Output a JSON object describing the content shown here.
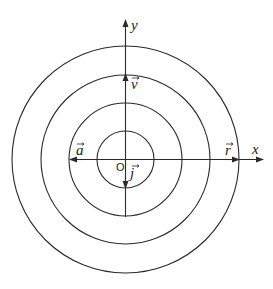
{
  "diagram": {
    "type": "concentric-circles-with-axes",
    "circle_count": 4,
    "colors": {
      "stroke": "#2a2a2a",
      "background": "#ffffff"
    },
    "axes": {
      "x_label": "x",
      "y_label": "y",
      "origin_label": "O"
    },
    "vectors": [
      {
        "id": "v",
        "label": "v",
        "direction": "up"
      },
      {
        "id": "a",
        "label": "a",
        "direction": "left"
      },
      {
        "id": "r",
        "label": "r",
        "direction": "right"
      },
      {
        "id": "j",
        "label": "j",
        "direction": "down"
      }
    ]
  }
}
